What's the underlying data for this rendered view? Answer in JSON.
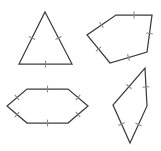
{
  "sheet": {
    "title": "Congruent-side geometric figures",
    "background_color": "#ffffff",
    "width": 161,
    "height": 151,
    "stroke_color": "#3c3c3c",
    "tick_color": "#8a8a8a"
  },
  "figures": [
    {
      "id": "triangle",
      "name": "equilateral-triangle",
      "label": "Equilateral triangle",
      "sides": 3,
      "tick_marks_per_side": 1,
      "position": "top-left",
      "points": "45,12 72,64 19,64"
    },
    {
      "id": "pentagon",
      "name": "pentagon",
      "label": "Equilateral pentagon",
      "sides": 5,
      "tick_marks_per_side": 1,
      "position": "top-right",
      "points": "116,15 152,15 147,52 110,63 87,35"
    },
    {
      "id": "hexagon",
      "name": "hexagon",
      "label": "Equilateral hexagon",
      "sides": 6,
      "tick_marks_per_side": 1,
      "position": "bottom-left",
      "points": "27,89 68,89 88,106 68,123 27,123 7,106"
    },
    {
      "id": "rhombus",
      "name": "rhombus",
      "label": "Rhombus",
      "sides": 4,
      "tick_marks_per_side": 1,
      "position": "bottom-right",
      "points": "145,68 147,106 130,143 113,105"
    }
  ]
}
